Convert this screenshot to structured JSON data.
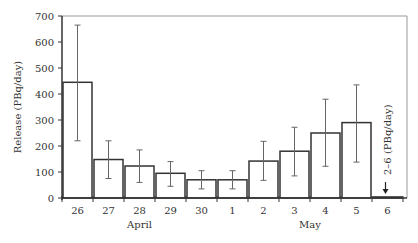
{
  "chart_data": {
    "type": "bar",
    "title": "",
    "xlabel": "",
    "ylabel": "Release (PBq/day)",
    "ylim": [
      0,
      700
    ],
    "yticks": [
      0,
      100,
      200,
      300,
      400,
      500,
      600,
      700
    ],
    "grid": false,
    "categories": [
      "26",
      "27",
      "28",
      "29",
      "30",
      "1",
      "2",
      "3",
      "4",
      "5",
      "6"
    ],
    "month_labels": [
      {
        "label": "April",
        "span": [
          "26",
          "30"
        ]
      },
      {
        "label": "May",
        "span": [
          "1",
          "6"
        ]
      }
    ],
    "values": [
      445,
      148,
      123,
      95,
      70,
      70,
      142,
      180,
      250,
      290,
      4
    ],
    "error_low": [
      220,
      75,
      60,
      45,
      35,
      35,
      68,
      85,
      122,
      138,
      null
    ],
    "error_high": [
      665,
      220,
      185,
      140,
      105,
      105,
      218,
      272,
      380,
      435,
      null
    ],
    "annotations": [
      {
        "category": "6",
        "text": "2–6 (PBq/day)",
        "arrow": "down"
      }
    ]
  },
  "colors": {
    "bar_fill": "#ffffff",
    "bar_stroke": "#333333",
    "axis": "#333333",
    "frame": "#999999",
    "errorbar": "#666666"
  }
}
